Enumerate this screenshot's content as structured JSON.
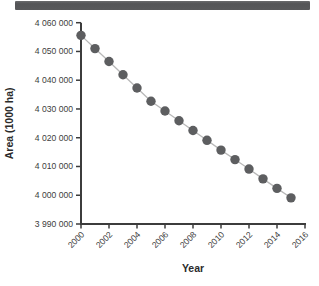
{
  "top_bar": {
    "color": "#58595b"
  },
  "chart_data": {
    "type": "scatter",
    "title": "",
    "xlabel": "Year",
    "ylabel": "Area (1000 ha)",
    "x": [
      2000,
      2001,
      2002,
      2003,
      2004,
      2005,
      2006,
      2007,
      2008,
      2009,
      2010,
      2011,
      2012,
      2013,
      2014,
      2015
    ],
    "values": [
      4055600,
      4051000,
      4046500,
      4041900,
      4037300,
      4032700,
      4029300,
      4025900,
      4022500,
      4019100,
      4015700,
      4012400,
      4009100,
      4005700,
      4002400,
      3999100
    ],
    "series_name": "Forest area",
    "xlim": [
      2000,
      2016
    ],
    "ylim": [
      3990000,
      4060000
    ],
    "x_ticks": [
      2000,
      2002,
      2004,
      2006,
      2008,
      2010,
      2012,
      2014,
      2016
    ],
    "x_tick_labels": [
      "2000",
      "2002",
      "2004",
      "2006",
      "2008",
      "2010",
      "2012",
      "2014",
      "2016"
    ],
    "y_ticks": [
      3990000,
      4000000,
      4010000,
      4020000,
      4030000,
      4040000,
      4050000,
      4060000
    ],
    "y_tick_labels": [
      "3 990 000",
      "4 000 000",
      "4 010 000",
      "4 020 000",
      "4 030 000",
      "4 040 000",
      "4 050 000",
      "4 060 000"
    ],
    "grid": false,
    "legend": "none",
    "marker": "circle",
    "connector_line": true
  },
  "colors": {
    "point": "#5d5e60",
    "line": "#b8b8b8",
    "axis": "#3c3c3c",
    "tick_label": "#3d3d3d",
    "axis_title": "#2b2b2b",
    "top_bar": "#58595b",
    "background": "#ffffff"
  }
}
